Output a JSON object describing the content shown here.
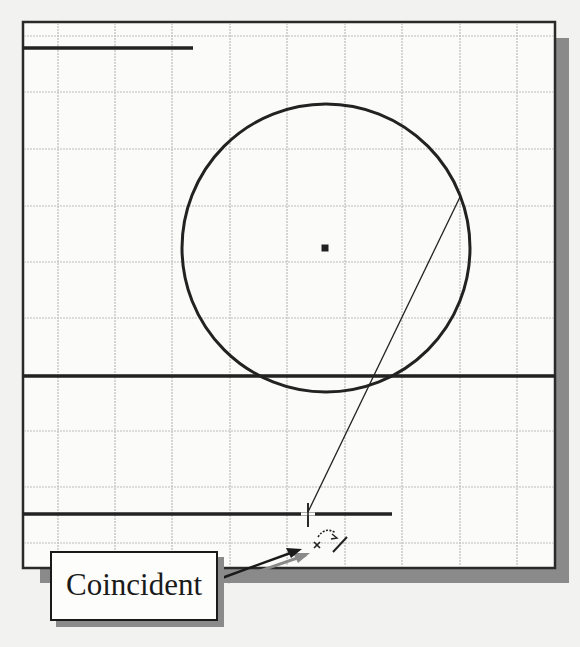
{
  "canvas": {
    "background": "#f2f2f0",
    "frame": {
      "left": 23,
      "top": 22,
      "right": 555,
      "bottom": 568,
      "border_color": "#2a2a2a",
      "fill": "#fbfbfa",
      "shadow_color": "#8a8a8a"
    },
    "grid": {
      "color": "#bdbdbd",
      "vertical_x": [
        58,
        115,
        172,
        230,
        287,
        345,
        402,
        460,
        517
      ],
      "horizontal_y": [
        36,
        92,
        149,
        206,
        262,
        318,
        375,
        431,
        487,
        543
      ]
    }
  },
  "sketch": {
    "line_color": "#222222",
    "top_line": {
      "x1": 23,
      "y1": 48,
      "x2": 193,
      "y2": 48
    },
    "circle": {
      "cx": 326,
      "cy": 248,
      "r": 144
    },
    "center_point": {
      "x": 325,
      "y": 248
    },
    "middle_line": {
      "x1": 23,
      "y1": 376,
      "x2": 555,
      "y2": 376
    },
    "bottom_line": {
      "x1": 23,
      "y1": 514,
      "x2": 392,
      "y2": 514
    },
    "rubber_band_line": {
      "x1": 460,
      "y1": 197,
      "x2": 308,
      "y2": 512
    }
  },
  "cursor": {
    "crosshair": {
      "x": 308,
      "y": 514
    },
    "constraint_icon": "coincident-constraint-icon"
  },
  "callout": {
    "label": "Coincident",
    "arrow": {
      "x1": 222,
      "y1": 578,
      "x2": 302,
      "y2": 549
    }
  }
}
